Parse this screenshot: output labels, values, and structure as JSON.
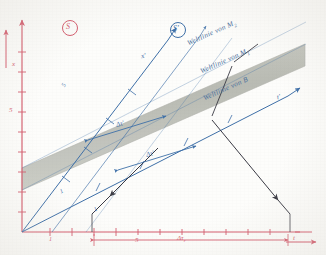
{
  "figure": {
    "kind": "minkowski-spacetime-diagram",
    "style": "hand-drawn pencil and pen on paper, scanned",
    "frames": [
      {
        "name": "S",
        "badge": "S",
        "color": "#d4596b"
      },
      {
        "name": "S'",
        "badge": "S'",
        "color": "#3d6fa8"
      }
    ],
    "axes": {
      "unprimed": {
        "color": "#d4596b",
        "vertical": {
          "label": "x",
          "ticks": [
            "5"
          ],
          "arrow": "up"
        },
        "horizontal": {
          "label": "t",
          "ticks": [
            "1",
            "5"
          ],
          "arrow": "right"
        }
      },
      "primed": {
        "color": "#3d6fa8",
        "space": {
          "label": "x'",
          "arrow": "up-right"
        },
        "time": {
          "label": "t'",
          "arrow": "right-up"
        },
        "extra_ticks": [
          "1",
          "5"
        ]
      }
    },
    "worldlines": [
      {
        "label": "Weltlinie von M",
        "sub": "2",
        "color": "#4a6f9c"
      },
      {
        "label": "Weltlinie von M",
        "sub": "1",
        "color": "#4a6f9c"
      },
      {
        "label": "Weltlinie von B",
        "sub": "",
        "color": "#4a6f9c"
      }
    ],
    "band": {
      "name": "mirror-band",
      "fill": "#b9bbb4",
      "note": "shaded strip between the two mirror world lines"
    },
    "intervals": [
      {
        "name": "delta-tau-prime-upper",
        "label": "Δτ'",
        "color": "#3d6fa8"
      },
      {
        "name": "delta-tau-prime-lower",
        "label": "Δτ'",
        "color": "#3d6fa8"
      },
      {
        "name": "delta-tau-r",
        "label": "Δτ",
        "sub": "r",
        "color": "#d4596b"
      }
    ],
    "light_rays": {
      "name": "light-ray-arrows",
      "color": "#3a3a44",
      "count": 3
    }
  }
}
